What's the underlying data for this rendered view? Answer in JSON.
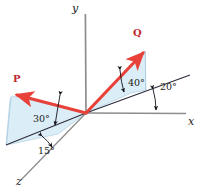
{
  "figure": {
    "type": "vector-diagram-3d",
    "background": "#ffffff",
    "colors": {
      "vector": "#e8413a",
      "vector_label": "#c0272d",
      "axis": "#8d8d8d",
      "construction_line": "#2b2b3c",
      "plane_fill": "#d8ebf5",
      "plane_edge": "#9cc4dc",
      "text": "#1a1a1a"
    }
  },
  "axes": [
    {
      "name": "y-axis",
      "label": "y",
      "x": 72,
      "y": 3
    },
    {
      "name": "x-axis",
      "label": "x",
      "x": 188,
      "y": 116
    },
    {
      "name": "z-axis",
      "label": "z",
      "x": 16,
      "y": 176
    }
  ],
  "origin": {
    "x": 86,
    "y": 113
  },
  "vectors": [
    {
      "name": "P",
      "label": "P",
      "label_x": 13,
      "label_y": 74,
      "tip_x": 14,
      "tip_y": 95
    },
    {
      "name": "Q",
      "label": "Q",
      "label_x": 133,
      "label_y": 28,
      "tip_x": 146,
      "tip_y": 50
    }
  ],
  "angles": [
    {
      "name": "angle-30",
      "label": "30°",
      "value": 30,
      "x": 33,
      "y": 114,
      "desc": "P elevation above its base line"
    },
    {
      "name": "angle-15",
      "label": "15°",
      "value": 15,
      "x": 38,
      "y": 146,
      "desc": "P base line from z-axis"
    },
    {
      "name": "angle-40",
      "label": "40°",
      "value": 40,
      "x": 128,
      "y": 78,
      "desc": "Q elevation above its base line"
    },
    {
      "name": "angle-20",
      "label": "20°",
      "value": 20,
      "x": 160,
      "y": 82,
      "desc": "Q base line from x-axis"
    }
  ]
}
